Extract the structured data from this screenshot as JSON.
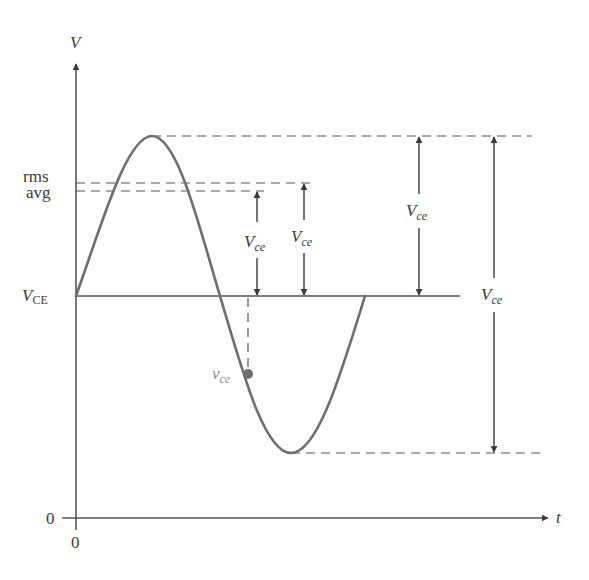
{
  "figure": {
    "colors": {
      "axis": "#555555",
      "curve": "#6e6e6e",
      "text": "#3a3a3a",
      "vce_label": "#8a8a8a"
    },
    "axes": {
      "y_label": "V",
      "x_label": "t",
      "y_origin_label": "0",
      "x_origin_label": "0"
    },
    "levels": {
      "rms_label": "rms",
      "avg_label": "avg",
      "dc_label_main": "V",
      "dc_label_sub": "CE"
    },
    "dimensions": [
      {
        "id": "avg-amplitude",
        "label_main": "V",
        "label_sub": "ce",
        "from": "avg",
        "to": "V_CE"
      },
      {
        "id": "rms-amplitude",
        "label_main": "V",
        "label_sub": "ce",
        "from": "rms",
        "to": "V_CE"
      },
      {
        "id": "peak-amplitude",
        "label_main": "V",
        "label_sub": "ce",
        "from": "peak",
        "to": "V_CE"
      },
      {
        "id": "peak-to-peak",
        "label_main": "V",
        "label_sub": "ce",
        "from": "peak",
        "to": "trough"
      }
    ],
    "instantaneous": {
      "label_main": "v",
      "label_sub": "ce"
    }
  }
}
